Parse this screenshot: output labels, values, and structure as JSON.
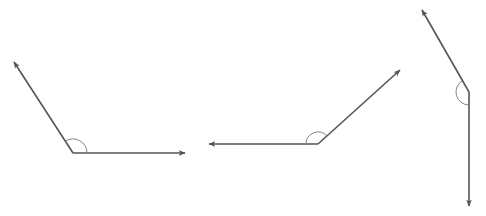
{
  "diagram": {
    "title": "",
    "colors": {
      "ray": "#555555",
      "arc": "#777777",
      "background": "#ffffff"
    },
    "angles": [
      {
        "name": "angle-1",
        "vertex": [
          73,
          153
        ],
        "ray_a_tip": [
          14,
          62
        ],
        "ray_b_tip": [
          185,
          153
        ],
        "arc_radius": 14,
        "type": "obtuse"
      },
      {
        "name": "angle-2",
        "vertex": [
          318,
          144
        ],
        "ray_a_tip": [
          209,
          144
        ],
        "ray_b_tip": [
          400,
          70
        ],
        "arc_radius": 12,
        "type": "obtuse"
      },
      {
        "name": "angle-3",
        "vertex": [
          469,
          92
        ],
        "ray_a_tip": [
          422,
          10
        ],
        "ray_b_tip": [
          469,
          206
        ],
        "arc_radius": 13,
        "type": "obtuse"
      }
    ]
  }
}
